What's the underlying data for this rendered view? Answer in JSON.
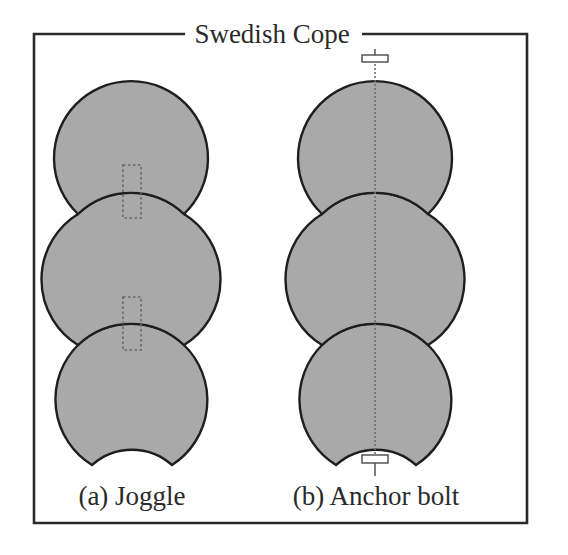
{
  "figure": {
    "title": "Swedish Cope",
    "panels": [
      {
        "id": "a",
        "caption": "(a) Joggle",
        "logs": 3,
        "connector": "joggle",
        "joggle_count": 2
      },
      {
        "id": "b",
        "caption": "(b) Anchor bolt",
        "logs": 3,
        "connector": "anchor-bolt",
        "bolt_count": 1
      }
    ]
  },
  "colors": {
    "log_fill": "#a9a9a9",
    "log_outline": "#1e1e1e",
    "frame": "#2a2a2a",
    "connector_dashed": "#6a6a6a",
    "background": "#ffffff"
  }
}
